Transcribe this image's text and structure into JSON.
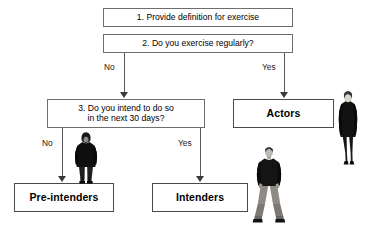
{
  "diagram": {
    "background_color": "#ffffff",
    "box_border_color": "#6e6e6e",
    "outcome_border_color": "#4a4a4a",
    "connector_color": "#5a5a5a",
    "text_color": "#000000"
  },
  "nodes": {
    "step1": {
      "label": "1. Provide definition for exercise",
      "type": "process"
    },
    "step2": {
      "label": "2. Do you exercise regularly?",
      "type": "decision"
    },
    "step3": {
      "line1": "3. Do you intend to do so",
      "line2": "in the next 30 days?",
      "type": "decision"
    },
    "actors": {
      "label": "Actors",
      "type": "outcome"
    },
    "pre_intenders": {
      "label": "Pre-intenders",
      "type": "outcome"
    },
    "intenders": {
      "label": "Intenders",
      "type": "outcome"
    }
  },
  "edges": {
    "step2_no": "No",
    "step2_yes": "Yes",
    "step3_no": "No",
    "step3_yes": "Yes"
  },
  "figures": {
    "actor_person": "standing-woman-dark-coat",
    "pre_intender_person": "standing-person-dark-hooded-coat",
    "intender_person": "standing-man-dark-jacket-jeans"
  }
}
